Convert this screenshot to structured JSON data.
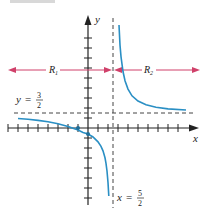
{
  "figure": {
    "title_cut": "FIGURE",
    "function": "f(x) = (3x + 3)/(2x - 5)",
    "origin_px": [
      88,
      128
    ],
    "unit_px": 10,
    "axes": {
      "x_label": "x",
      "y_label": "y"
    },
    "asymptotes": {
      "horizontal": {
        "label_var": "y",
        "label_eq": "=",
        "num": "3",
        "den": "2",
        "value": 1.5
      },
      "vertical": {
        "label_var": "x",
        "label_eq": "=",
        "num": "5",
        "den": "2",
        "value": 2.5
      }
    },
    "regions": [
      {
        "label": "R",
        "sub": "1",
        "direction": "left"
      },
      {
        "label": "R",
        "sub": "2",
        "direction": "right"
      }
    ],
    "points": [
      {
        "name": "x-intercept",
        "x": -1,
        "y": 0
      },
      {
        "name": "y-intercept",
        "x": 0,
        "y": -0.6
      }
    ],
    "colors": {
      "curve": "#2a8fc4",
      "arrows": "#d0406a",
      "axes": "#222222",
      "dashed": "#444444",
      "heading": "#c8b020"
    }
  }
}
